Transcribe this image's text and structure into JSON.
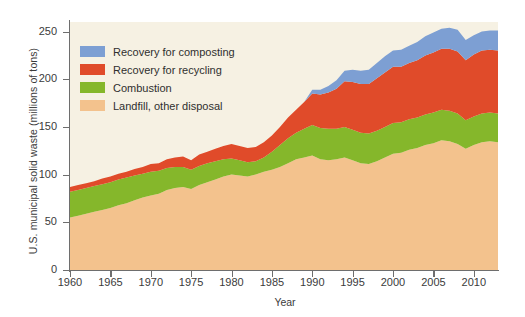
{
  "chart_data": {
    "type": "area",
    "stacked": true,
    "title": "",
    "xlabel": "Year",
    "ylabel": "U.S. municipal solid waste (millions of tons)",
    "xlim": [
      1960,
      2013
    ],
    "ylim": [
      0,
      260
    ],
    "yticks": [
      0,
      50,
      100,
      150,
      200,
      250
    ],
    "xticks": [
      1960,
      1965,
      1970,
      1975,
      1980,
      1985,
      1990,
      1995,
      2000,
      2005,
      2010
    ],
    "grid": false,
    "legend_position": "top-left inside plot",
    "plot_background": "#f6f1e3",
    "x": [
      1960,
      1961,
      1962,
      1963,
      1964,
      1965,
      1966,
      1967,
      1968,
      1969,
      1970,
      1971,
      1972,
      1973,
      1974,
      1975,
      1976,
      1977,
      1978,
      1979,
      1980,
      1981,
      1982,
      1983,
      1984,
      1985,
      1986,
      1987,
      1988,
      1989,
      1990,
      1991,
      1992,
      1993,
      1994,
      1995,
      1996,
      1997,
      1998,
      1999,
      2000,
      2001,
      2002,
      2003,
      2004,
      2005,
      2006,
      2007,
      2008,
      2009,
      2010,
      2011,
      2012,
      2013
    ],
    "series": [
      {
        "name": "Landfill, other disposal",
        "color": "#f3c28d",
        "values": [
          55,
          57,
          59,
          61,
          63,
          65,
          68,
          70,
          73,
          76,
          78,
          80,
          84,
          86,
          87,
          85,
          89,
          92,
          95,
          98,
          100,
          99,
          98,
          100,
          103,
          105,
          108,
          112,
          116,
          118,
          120,
          116,
          115,
          116,
          118,
          115,
          112,
          111,
          114,
          118,
          122,
          123,
          126,
          128,
          131,
          133,
          136,
          135,
          132,
          127,
          131,
          134,
          135,
          134
        ]
      },
      {
        "name": "Combustion",
        "color": "#85b72b",
        "values": [
          27,
          27,
          27,
          27,
          27,
          27,
          27,
          27,
          26,
          25,
          25,
          24,
          23,
          22,
          21,
          20,
          20,
          20,
          19,
          18,
          17,
          16,
          15,
          14,
          15,
          19,
          23,
          26,
          28,
          30,
          32,
          33,
          33,
          32,
          32,
          32,
          32,
          32,
          32,
          32,
          32,
          32,
          32,
          32,
          32,
          32,
          32,
          32,
          32,
          30,
          30,
          30,
          30,
          30
        ]
      },
      {
        "name": "Recovery for recycling",
        "color": "#e04b2a",
        "values": [
          5,
          5,
          5,
          5,
          6,
          6,
          6,
          6,
          7,
          7,
          8,
          8,
          9,
          10,
          11,
          10,
          12,
          12,
          13,
          14,
          15,
          15,
          15,
          15,
          16,
          17,
          19,
          22,
          24,
          28,
          33,
          35,
          38,
          42,
          48,
          50,
          51,
          52,
          55,
          57,
          59,
          58,
          59,
          60,
          62,
          63,
          64,
          65,
          65,
          63,
          65,
          66,
          66,
          66
        ]
      },
      {
        "name": "Recovery for composting",
        "color": "#7d9fd3",
        "values": [
          0,
          0,
          0,
          0,
          0,
          0,
          0,
          0,
          0,
          0,
          0,
          0,
          0,
          0,
          0,
          0,
          0,
          0,
          0,
          0,
          0,
          0,
          0,
          0,
          0,
          0,
          0,
          0,
          0,
          0,
          4,
          5,
          7,
          9,
          11,
          13,
          14,
          15,
          16,
          17,
          17,
          18,
          18,
          19,
          20,
          21,
          21,
          22,
          23,
          21,
          20,
          20,
          20,
          21
        ]
      }
    ]
  },
  "legend": {
    "items": [
      {
        "label": "Recovery for composting",
        "color": "#7d9fd3"
      },
      {
        "label": "Recovery for recycling",
        "color": "#e04b2a"
      },
      {
        "label": "Combustion",
        "color": "#85b72b"
      },
      {
        "label": "Landfill, other disposal",
        "color": "#f3c28d"
      }
    ]
  },
  "axes": {
    "y_title": "U.S. municipal solid waste (millions of tons)",
    "x_title": "Year",
    "y_ticks": [
      "0",
      "50",
      "100",
      "150",
      "200",
      "250"
    ],
    "x_ticks": [
      "1960",
      "1965",
      "1970",
      "1975",
      "1980",
      "1985",
      "1990",
      "1995",
      "2000",
      "2005",
      "2010"
    ]
  }
}
